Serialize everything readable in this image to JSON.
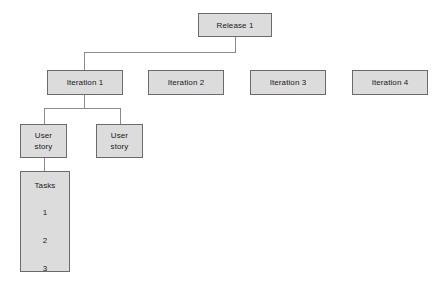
{
  "diagram": {
    "type": "tree",
    "style": {
      "node_fill": "#dcdcdc",
      "node_border": "#6b6b6b",
      "edge_color": "#8a8a8a",
      "background": "#ffffff",
      "text_color": "#1a1a1a"
    },
    "nodes": {
      "release": {
        "label": "Release 1"
      },
      "iterations": [
        {
          "label": "Iteration 1"
        },
        {
          "label": "Iteration 2"
        },
        {
          "label": "Iteration 3"
        },
        {
          "label": "Iteration 4"
        }
      ],
      "user_stories": [
        {
          "label": "User\nstory"
        },
        {
          "label": "User\nstory"
        }
      ],
      "tasks": {
        "title": "Tasks",
        "items": [
          "1",
          "2",
          "3"
        ]
      }
    }
  }
}
